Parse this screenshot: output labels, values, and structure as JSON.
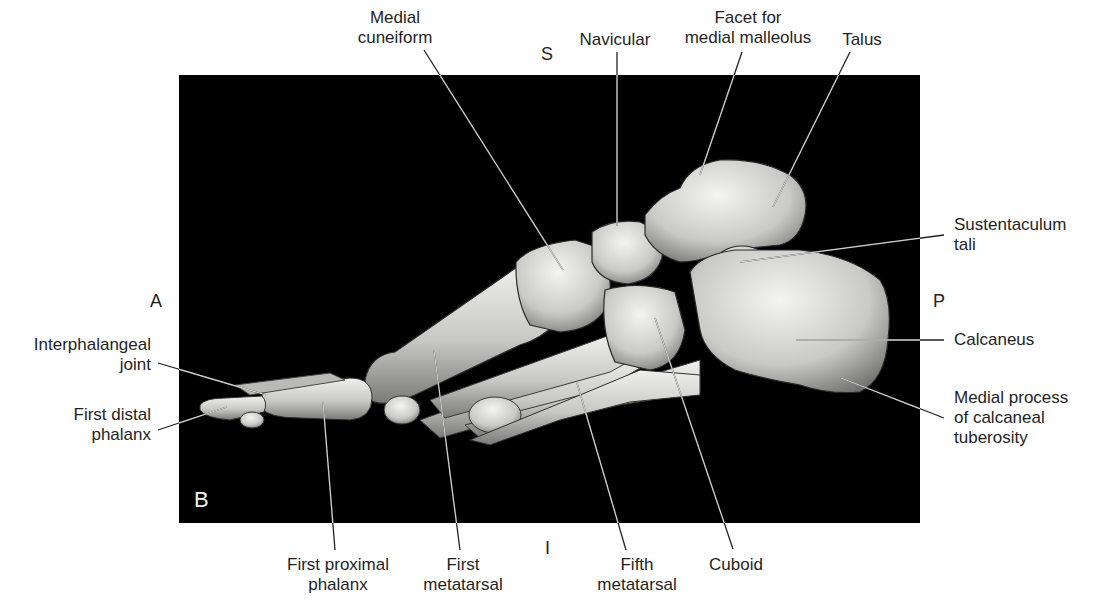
{
  "figure": {
    "panel_letter": "B",
    "panel_background": "#000000",
    "bone_color": "#d9d9d6",
    "leader_color_on_white": "#222222",
    "leader_color_on_black": "#cfcfcf"
  },
  "orientation": {
    "superior": "S",
    "inferior": "I",
    "anterior": "A",
    "posterior": "P"
  },
  "labels": [
    {
      "id": "medial-cuneiform",
      "text": "Medial\ncuneiform",
      "x": 395,
      "y": 8,
      "align": "center",
      "line": [
        [
          424,
          50
        ],
        [
          563,
          270
        ]
      ]
    },
    {
      "id": "navicular",
      "text": "Navicular",
      "x": 615,
      "y": 30,
      "align": "center",
      "line": [
        [
          617,
          52
        ],
        [
          617,
          226
        ]
      ]
    },
    {
      "id": "facet-medial-malleolus",
      "text": "Facet for\nmedial malleolus",
      "x": 748,
      "y": 8,
      "align": "center",
      "line": [
        [
          742,
          52
        ],
        [
          700,
          175
        ]
      ]
    },
    {
      "id": "talus",
      "text": "Talus",
      "x": 862,
      "y": 30,
      "align": "center",
      "line": [
        [
          850,
          52
        ],
        [
          773,
          207
        ]
      ]
    },
    {
      "id": "sustentaculum-tali",
      "text": "Sustentaculum\ntali",
      "x": 954,
      "y": 215,
      "align": "left",
      "line": [
        [
          944,
          235
        ],
        [
          740,
          262
        ]
      ]
    },
    {
      "id": "calcaneus",
      "text": "Calcaneus",
      "x": 954,
      "y": 330,
      "align": "left",
      "line": [
        [
          944,
          340
        ],
        [
          796,
          340
        ]
      ]
    },
    {
      "id": "medial-process-calcaneal-tuberosity",
      "text": "Medial process\nof calcaneal\ntuberosity",
      "x": 954,
      "y": 388,
      "align": "left",
      "line": [
        [
          944,
          418
        ],
        [
          841,
          378
        ]
      ]
    },
    {
      "id": "interphalangeal-joint",
      "text": "Interphalangeal\njoint",
      "x": 151,
      "y": 335,
      "align": "right",
      "line": [
        [
          158,
          363
        ],
        [
          266,
          395
        ]
      ]
    },
    {
      "id": "first-distal-phalanx",
      "text": "First distal\nphalanx",
      "x": 151,
      "y": 405,
      "align": "right",
      "line": [
        [
          158,
          430
        ],
        [
          227,
          407
        ]
      ]
    },
    {
      "id": "first-proximal-phalanx",
      "text": "First proximal\nphalanx",
      "x": 338,
      "y": 555,
      "align": "center",
      "line": [
        [
          335,
          550
        ],
        [
          323,
          402
        ]
      ]
    },
    {
      "id": "first-metatarsal",
      "text": "First\nmetatarsal",
      "x": 463,
      "y": 555,
      "align": "center",
      "line": [
        [
          460,
          550
        ],
        [
          434,
          350
        ]
      ]
    },
    {
      "id": "fifth-metatarsal",
      "text": "Fifth\nmetatarsal",
      "x": 637,
      "y": 555,
      "align": "center",
      "line": [
        [
          626,
          550
        ],
        [
          577,
          383
        ]
      ]
    },
    {
      "id": "cuboid",
      "text": "Cuboid",
      "x": 736,
      "y": 555,
      "align": "center",
      "line": [
        [
          733,
          549
        ],
        [
          655,
          318
        ]
      ]
    }
  ]
}
